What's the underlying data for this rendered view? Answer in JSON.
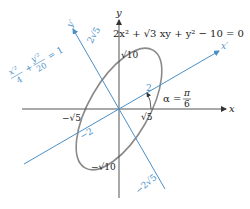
{
  "figure": {
    "equation": "2x² + √3 xy + y² − 10 = 0",
    "rotated_equation": {
      "term1_num": "x′²",
      "term1_den": "4",
      "plus": "+",
      "term2_num": "y′²",
      "term2_den": "20",
      "equals": "= 1"
    },
    "axes": {
      "x": "x",
      "y": "y",
      "x_prime": "x′",
      "y_prime": "y′"
    },
    "angle": {
      "label": "α =",
      "num": "π",
      "den": "6"
    },
    "ticks": {
      "y_pos": "√10",
      "y_neg": "−√10",
      "x_pos": "√5",
      "x_neg": "−√5",
      "xp_pos": "2",
      "xp_neg": "−2",
      "yp_pos": "2√5",
      "yp_neg": "−2√5"
    },
    "colors": {
      "axis": "#555555",
      "rotated_axis": "#4a90c8",
      "ellipse": "#808080",
      "text": "#222222",
      "blue_text": "#4a90c8"
    }
  }
}
